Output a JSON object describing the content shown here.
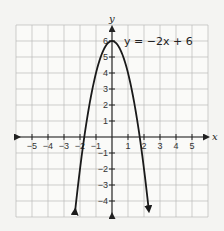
{
  "chart_data": {
    "type": "line",
    "title": "",
    "equation_label": "y = −2x + 6",
    "function": "y = -2x^2 + 6",
    "xlabel": "x",
    "ylabel": "y",
    "xlim": [
      -6,
      6
    ],
    "ylim": [
      -5,
      7
    ],
    "grid": true,
    "x_ticks": [
      -5,
      -4,
      -3,
      -2,
      -1,
      1,
      2,
      3,
      4,
      5
    ],
    "x_tick_labels": [
      "−5",
      "−4",
      "−3",
      "−2",
      "−1",
      "1",
      "2",
      "3",
      "4",
      "5"
    ],
    "y_ticks": [
      -4,
      -3,
      -2,
      -1,
      1,
      2,
      3,
      4,
      5,
      6
    ],
    "y_tick_labels": [
      "−4",
      "−3",
      "−2",
      "−1",
      "1",
      "2",
      "3",
      "4",
      "5",
      "6"
    ],
    "series": [
      {
        "name": "parabola",
        "coefficients": {
          "a": -2,
          "b": 0,
          "c": 6
        },
        "x_range": [
          -2.3,
          2.3
        ],
        "arrows": "both-ends",
        "color": "#1a1a1a",
        "points": [
          {
            "x": -2.3,
            "y": -4.58
          },
          {
            "x": -2,
            "y": -2
          },
          {
            "x": -1.73,
            "y": 0
          },
          {
            "x": -1,
            "y": 4
          },
          {
            "x": 0,
            "y": 6
          },
          {
            "x": 1,
            "y": 4
          },
          {
            "x": 1.73,
            "y": 0
          },
          {
            "x": 2,
            "y": -2
          },
          {
            "x": 2.3,
            "y": -4.58
          }
        ]
      }
    ]
  },
  "layout": {
    "origin_px": [
      112,
      137
    ],
    "unit_px": 16,
    "grid_color": "#b9b9b9",
    "axis_color": "#222222",
    "background": "#f4f4f2",
    "grid_bg": "#fafaf8"
  }
}
